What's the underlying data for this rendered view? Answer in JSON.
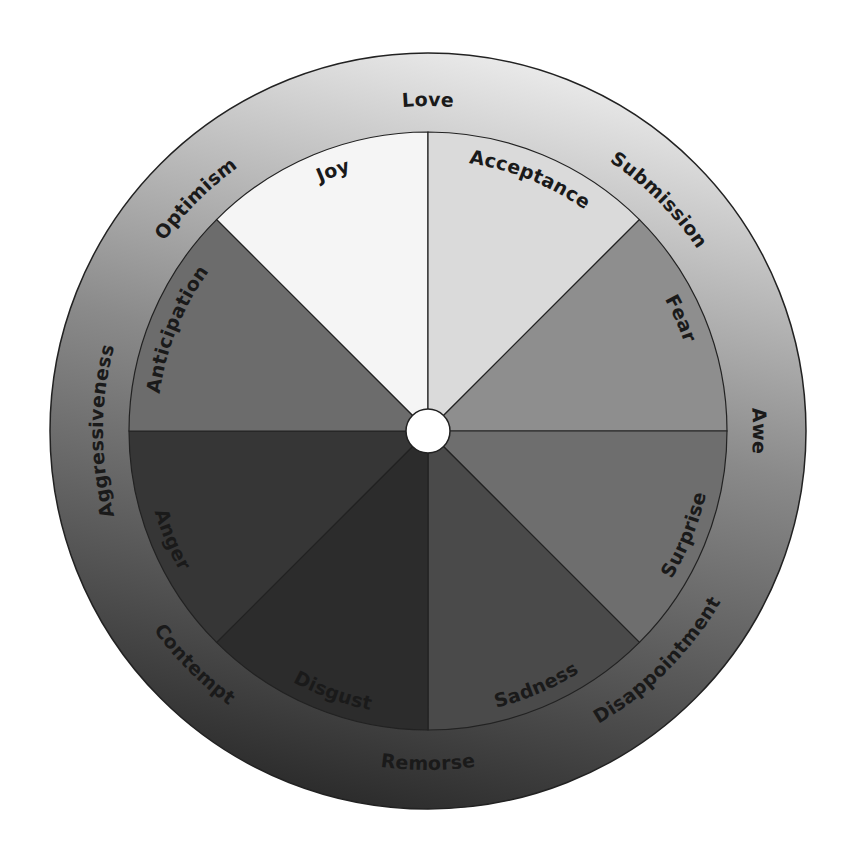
{
  "diagram": {
    "type": "emotion-wheel",
    "center": {
      "x": 428,
      "y": 431
    },
    "radii": {
      "hub": 22,
      "inner": 299,
      "outer": 378
    },
    "colors": {
      "stroke": "#222222",
      "hub": "#ffffff",
      "outer_ring_light": "#ececec",
      "outer_ring_mid": "#8a8a8a",
      "outer_ring_dark": "#2a2a2a"
    },
    "primary_emotions": [
      {
        "label": "Joy",
        "start": -45,
        "end": 0,
        "color": "#f5f5f5",
        "label_angle": -20,
        "dir": "cw"
      },
      {
        "label": "Acceptance",
        "start": 0,
        "end": 45,
        "color": "#dadada",
        "label_angle": 22,
        "dir": "cw"
      },
      {
        "label": "Fear",
        "start": 45,
        "end": 90,
        "color": "#8e8e8e",
        "label_angle": 66,
        "dir": "cw"
      },
      {
        "label": "Surprise",
        "start": 90,
        "end": 135,
        "color": "#6e6e6e",
        "label_angle": 112,
        "dir": "ccw"
      },
      {
        "label": "Sadness",
        "start": 135,
        "end": 180,
        "color": "#4a4a4a",
        "label_angle": 157,
        "dir": "ccw"
      },
      {
        "label": "Disgust",
        "start": 180,
        "end": 225,
        "color": "#2c2c2c",
        "label_angle": 200,
        "dir": "ccw"
      },
      {
        "label": "Anger",
        "start": 225,
        "end": 270,
        "color": "#363636",
        "label_angle": 247,
        "dir": "ccw"
      },
      {
        "label": "Anticipation",
        "start": 270,
        "end": 315,
        "color": "#6c6c6c",
        "label_angle": 292,
        "dir": "cw"
      }
    ],
    "dyads": [
      {
        "label": "Love",
        "angle": 0,
        "dir": "cw"
      },
      {
        "label": "Submission",
        "angle": 45,
        "dir": "cw"
      },
      {
        "label": "Awe",
        "angle": 90,
        "dir": "cw"
      },
      {
        "label": "Disappointment",
        "angle": 135,
        "dir": "ccw"
      },
      {
        "label": "Remorse",
        "angle": 180,
        "dir": "ccw"
      },
      {
        "label": "Contempt",
        "angle": 225,
        "dir": "ccw"
      },
      {
        "label": "Aggressiveness",
        "angle": 270,
        "dir": "cw"
      },
      {
        "label": "Optimism",
        "angle": 315,
        "dir": "cw"
      }
    ]
  }
}
